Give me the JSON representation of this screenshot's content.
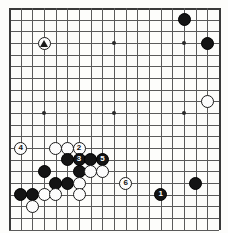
{
  "board": {
    "title": "Go game diagram",
    "size": 19,
    "origin_x": 9,
    "origin_y": 8,
    "spacing": 11.67,
    "cols_visible": 19,
    "rows_visible": 20,
    "colors": {
      "background": "#fdfdfb",
      "line": "#5a5a5a",
      "edge": "#3a3a3a",
      "black_stone": "#141414",
      "white_stone": "#fcfcfc",
      "black_label": "#ffffff",
      "white_label": "#101010"
    },
    "hoshi": [
      {
        "col": 3,
        "row": 3
      },
      {
        "col": 9,
        "row": 3
      },
      {
        "col": 15,
        "row": 3
      },
      {
        "col": 3,
        "row": 9
      },
      {
        "col": 9,
        "row": 9
      },
      {
        "col": 15,
        "row": 9
      }
    ],
    "stones": [
      {
        "col": 3,
        "row": 3,
        "color": "white",
        "label": "",
        "mark": "triangle",
        "name": "white-stone-marked-triangle"
      },
      {
        "col": 15,
        "row": 1,
        "color": "black",
        "label": "",
        "mark": "",
        "name": "black-stone-upper-right-a"
      },
      {
        "col": 17,
        "row": 3,
        "color": "black",
        "label": "",
        "mark": "",
        "name": "black-stone-upper-right-b"
      },
      {
        "col": 17,
        "row": 8,
        "color": "white",
        "label": "",
        "mark": "",
        "name": "white-stone-right-side"
      },
      {
        "col": 1,
        "row": 12,
        "color": "white",
        "label": "4",
        "mark": "",
        "name": "white-move-4"
      },
      {
        "col": 4,
        "row": 12,
        "color": "white",
        "label": "",
        "mark": "",
        "name": "white-stone-lower-left-a"
      },
      {
        "col": 5,
        "row": 12,
        "color": "white",
        "label": "",
        "mark": "",
        "name": "white-stone-lower-left-b"
      },
      {
        "col": 6,
        "row": 12,
        "color": "white",
        "label": "2",
        "mark": "",
        "name": "white-move-2"
      },
      {
        "col": 5,
        "row": 13,
        "color": "black",
        "label": "",
        "mark": "",
        "name": "black-stone-lower-left-a"
      },
      {
        "col": 6,
        "row": 13,
        "color": "black",
        "label": "3",
        "mark": "",
        "name": "black-move-3"
      },
      {
        "col": 7,
        "row": 13,
        "color": "black",
        "label": "",
        "mark": "",
        "name": "black-stone-lower-left-b"
      },
      {
        "col": 8,
        "row": 13,
        "color": "black",
        "label": "5",
        "mark": "",
        "name": "black-move-5"
      },
      {
        "col": 3,
        "row": 14,
        "color": "black",
        "label": "",
        "mark": "",
        "name": "black-stone-lower-left-c"
      },
      {
        "col": 6,
        "row": 14,
        "color": "black",
        "label": "",
        "mark": "",
        "name": "black-stone-lower-left-d"
      },
      {
        "col": 7,
        "row": 14,
        "color": "white",
        "label": "",
        "mark": "",
        "name": "white-stone-lower-left-c"
      },
      {
        "col": 8,
        "row": 14,
        "color": "white",
        "label": "",
        "mark": "",
        "name": "white-stone-lower-left-d"
      },
      {
        "col": 4,
        "row": 15,
        "color": "black",
        "label": "",
        "mark": "",
        "name": "black-stone-lower-left-e"
      },
      {
        "col": 5,
        "row": 15,
        "color": "black",
        "label": "",
        "mark": "",
        "name": "black-stone-lower-left-f"
      },
      {
        "col": 6,
        "row": 15,
        "color": "white",
        "label": "",
        "mark": "",
        "name": "white-stone-lower-left-e"
      },
      {
        "col": 10,
        "row": 15,
        "color": "white",
        "label": "6",
        "mark": "",
        "name": "white-move-6"
      },
      {
        "col": 16,
        "row": 15,
        "color": "black",
        "label": "",
        "mark": "",
        "name": "black-stone-lower-right"
      },
      {
        "col": 1,
        "row": 16,
        "color": "black",
        "label": "",
        "mark": "",
        "name": "black-stone-lower-left-g"
      },
      {
        "col": 2,
        "row": 16,
        "color": "black",
        "label": "",
        "mark": "",
        "name": "black-stone-lower-left-h"
      },
      {
        "col": 3,
        "row": 16,
        "color": "white",
        "label": "",
        "mark": "",
        "name": "white-stone-lower-left-f"
      },
      {
        "col": 4,
        "row": 16,
        "color": "white",
        "label": "",
        "mark": "",
        "name": "white-stone-lower-left-g"
      },
      {
        "col": 6,
        "row": 16,
        "color": "white",
        "label": "",
        "mark": "",
        "name": "white-stone-lower-left-h"
      },
      {
        "col": 13,
        "row": 16,
        "color": "black",
        "label": "1",
        "mark": "",
        "name": "black-move-1"
      },
      {
        "col": 2,
        "row": 17,
        "color": "white",
        "label": "",
        "mark": "",
        "name": "white-stone-lower-left-i"
      }
    ]
  }
}
